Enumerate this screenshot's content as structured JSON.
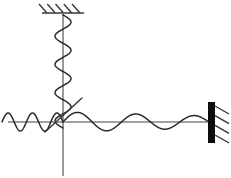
{
  "figure": {
    "background_color": "#ffffff",
    "width": 231,
    "height": 178,
    "stroke_color_axis": "#808080",
    "stroke_color_curve": "#2a2a2a",
    "stroke_color_wall": "#0d0d0d"
  },
  "elements": {
    "ceiling_support": {
      "label": "ceiling-support",
      "line_x1": 42,
      "line_y1": 13,
      "line_x2": 84,
      "line_y2": 13,
      "hatch_count": 5,
      "hatch_direction": "down-left"
    },
    "vertical_axis": {
      "label": "vertical-axis",
      "x": 63,
      "y_top": 13,
      "y_bottom": 176
    },
    "horizontal_axis": {
      "label": "horizontal-axis",
      "y": 122,
      "x_left": 8,
      "x_right": 210
    },
    "origin": {
      "label": "origin",
      "x": 63,
      "y": 122
    },
    "vertical_spring": {
      "label": "vertical-spring-oscillation",
      "center_x": 63,
      "y_start": 15,
      "y_end": 128,
      "amplitude": 8,
      "cycles": 4
    },
    "horizontal_wave_left": {
      "label": "left-wave-segment",
      "x_start": 2,
      "x_end": 63,
      "baseline_y": 122,
      "amplitude": 9,
      "cycles": 2.5
    },
    "horizontal_wave_right": {
      "label": "right-damped-wave-segment",
      "x_start": 63,
      "x_end": 209,
      "baseline_y": 122,
      "amplitude_start": 10,
      "amplitude_end": 6,
      "cycles": 2.5
    },
    "diagonal_line": {
      "label": "tangent-diagonal-line",
      "x1": 45,
      "y1": 132,
      "x2": 82,
      "y2": 98
    },
    "right_wall": {
      "label": "fixed-wall-boundary",
      "x": 208,
      "y": 102,
      "width": 7,
      "height": 41,
      "hatch_count": 4,
      "hatch_direction": "down-right"
    }
  },
  "chart_data": {
    "type": "line",
    "xlabel": "",
    "ylabel": "",
    "grid": false,
    "legend": "none",
    "axis_ranges": {
      "x": [
        8,
        210
      ],
      "y": [
        13,
        176
      ]
    },
    "series": [
      {
        "name": "vertical-spring",
        "orientation": "vertical",
        "center": 63,
        "amplitude": 8,
        "cycles": 4,
        "span": [
          15,
          128
        ]
      },
      {
        "name": "left-wave",
        "orientation": "horizontal",
        "baseline": 122,
        "amplitude": 9,
        "cycles": 2.5,
        "span": [
          2,
          63
        ]
      },
      {
        "name": "right-damped-wave",
        "orientation": "horizontal",
        "baseline": 122,
        "amplitude": [
          10,
          6
        ],
        "cycles": 2.5,
        "span": [
          63,
          209
        ]
      },
      {
        "name": "diagonal-tangent",
        "orientation": "diagonal",
        "points": [
          [
            45,
            132
          ],
          [
            82,
            98
          ]
        ]
      }
    ]
  }
}
